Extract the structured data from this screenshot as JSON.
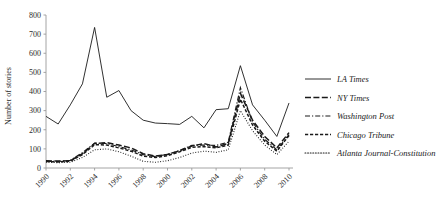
{
  "chart_data": {
    "type": "line",
    "title": "",
    "xlabel": "",
    "ylabel": "Number of stories",
    "x": [
      1990,
      1991,
      1992,
      1993,
      1994,
      1995,
      1996,
      1997,
      1998,
      1999,
      2000,
      2001,
      2002,
      2003,
      2004,
      2005,
      2006,
      2007,
      2008,
      2009,
      2010
    ],
    "xtick_labels": [
      "1990",
      "1992",
      "1994",
      "1996",
      "1998",
      "2000",
      "2002",
      "2004",
      "2006",
      "2008",
      "2010"
    ],
    "xtick_values": [
      1990,
      1992,
      1994,
      1996,
      1998,
      2000,
      2002,
      2004,
      2006,
      2008,
      2010
    ],
    "ytick_labels": [
      "0",
      "100",
      "200",
      "300",
      "400",
      "500",
      "600",
      "700",
      "800"
    ],
    "ytick_values": [
      0,
      100,
      200,
      300,
      400,
      500,
      600,
      700,
      800
    ],
    "ylim": [
      0,
      800
    ],
    "xlim": [
      1990,
      2010
    ],
    "grid": false,
    "legend_position": "right",
    "series": [
      {
        "name": "LA Times",
        "dash": "none",
        "width": 0.9,
        "values": [
          270,
          230,
          330,
          440,
          735,
          370,
          405,
          300,
          250,
          235,
          232,
          228,
          270,
          210,
          305,
          310,
          535,
          330,
          250,
          165,
          340
        ]
      },
      {
        "name": "NY Times",
        "dash": "long-dash",
        "width": 1.5,
        "values": [
          38,
          36,
          38,
          75,
          128,
          133,
          120,
          105,
          75,
          62,
          70,
          90,
          115,
          128,
          110,
          128,
          390,
          250,
          165,
          105,
          185
        ]
      },
      {
        "name": "Washington Post",
        "dash": "dash-dot",
        "width": 1.2,
        "values": [
          35,
          34,
          40,
          80,
          130,
          128,
          112,
          95,
          70,
          60,
          72,
          92,
          118,
          120,
          118,
          135,
          420,
          240,
          150,
          95,
          175
        ]
      },
      {
        "name": "Chicago Tribune",
        "dash": "short-dash",
        "width": 1.5,
        "values": [
          34,
          32,
          36,
          70,
          122,
          120,
          105,
          88,
          62,
          55,
          65,
          85,
          108,
          112,
          105,
          120,
          360,
          225,
          140,
          88,
          170
        ]
      },
      {
        "name": "Atlanta Journal-Constitution",
        "dash": "dotted",
        "width": 1.1,
        "values": [
          30,
          28,
          30,
          55,
          95,
          100,
          85,
          62,
          35,
          30,
          38,
          55,
          78,
          88,
          82,
          95,
          300,
          195,
          120,
          70,
          140
        ]
      }
    ]
  },
  "axes": {
    "ylabel": "Number of stories"
  },
  "legend": {
    "items": [
      {
        "label": "LA Times"
      },
      {
        "label": "NY Times"
      },
      {
        "label": "Washington Post"
      },
      {
        "label": "Chicago Tribune"
      },
      {
        "label": "Atlanta Journal-Constitution"
      }
    ]
  }
}
